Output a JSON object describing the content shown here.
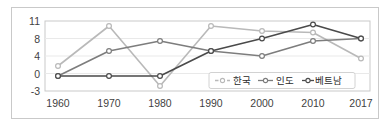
{
  "chart_data": {
    "type": "line",
    "title": "",
    "xlabel": "",
    "ylabel": "",
    "categories": [
      "1960",
      "1970",
      "1980",
      "1990",
      "2000",
      "2010",
      "2017"
    ],
    "x": [
      1960,
      1970,
      1980,
      1990,
      2000,
      2010,
      2017
    ],
    "yticks": [
      11,
      8,
      4,
      0,
      -3
    ],
    "ytick_labels": [
      "11",
      "8",
      "4",
      "0",
      "-3"
    ],
    "ylim": [
      -3,
      11
    ],
    "grid": true,
    "legend_position": "inside-lower-right",
    "series": [
      {
        "name": "한국",
        "color": "#b9b9b9",
        "marker": "circle-open",
        "values": [
          2.0,
          10.0,
          -2.0,
          10.0,
          9.0,
          8.7,
          3.5
        ]
      },
      {
        "name": "인도",
        "color": "#7d7d7d",
        "marker": "circle-open",
        "values": [
          0.0,
          5.0,
          7.0,
          5.0,
          4.0,
          7.0,
          7.5
        ]
      },
      {
        "name": "베트남",
        "color": "#4a4a4a",
        "marker": "circle-open",
        "values": [
          0.0,
          0.0,
          0.0,
          5.0,
          7.5,
          10.3,
          7.5
        ]
      }
    ]
  },
  "axis": {
    "ytick_0": "11",
    "ytick_1": "8",
    "ytick_2": "4",
    "ytick_3": "0",
    "ytick_4": "-3",
    "xtick_0": "1960",
    "xtick_1": "1970",
    "xtick_2": "1980",
    "xtick_3": "1990",
    "xtick_4": "2000",
    "xtick_5": "2010",
    "xtick_6": "2017"
  },
  "legend": {
    "item_0": "한국",
    "item_1": "인도",
    "item_2": "베트남"
  },
  "colors": {
    "series_korea": "#b9b9b9",
    "series_india": "#7d7d7d",
    "series_vietnam": "#4a4a4a",
    "plot_border": "#c9c9c9",
    "gridline": "#e6e6e6",
    "figure_border": "#c9c9c9",
    "tick_text": "#3f3f3f"
  }
}
